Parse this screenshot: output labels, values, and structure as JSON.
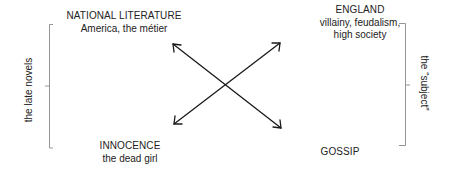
{
  "diagram": {
    "quadrants": {
      "top_left": {
        "heading": "NATIONAL LITERATURE",
        "lines": [
          "America, the métier"
        ]
      },
      "top_right": {
        "heading": "ENGLAND",
        "lines": [
          "villainy, feudalism,",
          "high society"
        ]
      },
      "bottom_left": {
        "heading": "INNOCENCE",
        "lines": [
          "the dead girl"
        ]
      },
      "bottom_right": {
        "heading": "GOSSIP",
        "lines": []
      }
    },
    "brackets": {
      "left": {
        "label": "the late novels"
      },
      "right": {
        "label": "the “subject”"
      }
    },
    "arrows": [
      {
        "from": "top_left",
        "to": "bottom_right",
        "type": "double-headed"
      },
      {
        "from": "bottom_left",
        "to": "top_right",
        "type": "double-headed"
      }
    ],
    "colors": {
      "text": "#222222",
      "arrow": "#1a1a1a",
      "bracket": "#8a8a8a",
      "background": "#ffffff"
    }
  }
}
